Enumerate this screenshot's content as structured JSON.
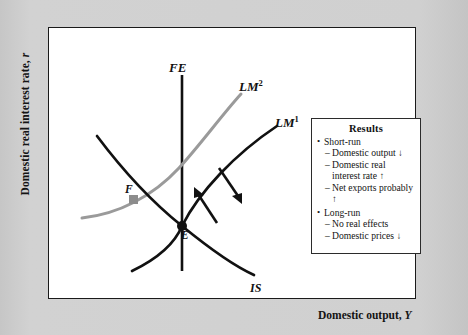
{
  "axes": {
    "y_label_text": "Domestic real interest rate, ",
    "y_label_var": "r",
    "x_label_text": "Domestic output, ",
    "x_label_var": "Y"
  },
  "curves": [
    {
      "id": "FE",
      "label": "FE",
      "sup": "",
      "color": "#111111",
      "kind": "vertical-line"
    },
    {
      "id": "LM2",
      "label": "LM",
      "sup": "2",
      "color": "#9a9a9a",
      "kind": "upward-sloping"
    },
    {
      "id": "LM1",
      "label": "LM",
      "sup": "1",
      "color": "#111111",
      "kind": "upward-sloping"
    },
    {
      "id": "IS",
      "label": "IS",
      "sup": "",
      "color": "#111111",
      "kind": "downward-sloping"
    }
  ],
  "points": [
    {
      "id": "E",
      "label": "E",
      "color": "#111111",
      "note": "initial equilibrium on FE, LM1 and IS"
    },
    {
      "id": "F",
      "label": "F",
      "color": "#8c8c8c",
      "note": "new short-run equilibrium on LM2 and IS"
    }
  ],
  "arrows": [
    {
      "id": "arrow-up-left",
      "direction": "up-left",
      "color": "#111111"
    },
    {
      "id": "arrow-down-right",
      "direction": "down-right",
      "color": "#111111"
    }
  ],
  "results": {
    "title": "Results",
    "groups": [
      {
        "heading": "Short-run",
        "items": [
          "Domestic output ↓",
          "Domestic real interest rate ↑",
          "Net exports probably ↑"
        ]
      },
      {
        "heading": "Long-run",
        "items": [
          "No real effects",
          "Domestic prices ↓"
        ]
      }
    ],
    "bullet_glyph": "•",
    "dash_glyph": "–"
  },
  "colors": {
    "mat": "#cfcfcf",
    "plot_background": "#ffffff",
    "plot_border": "#1a1a1a",
    "gray_curve": "#9a9a9a",
    "black_curve": "#111111"
  }
}
